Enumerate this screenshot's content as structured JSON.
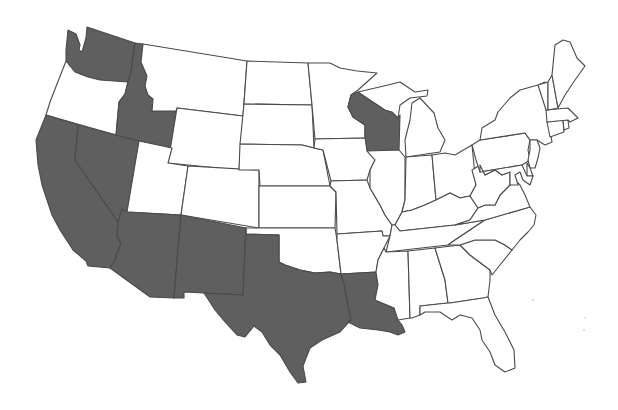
{
  "map": {
    "title": "",
    "region": "United States (contiguous)",
    "colors": {
      "highlighted": "#5f5f5f",
      "default": "#ffffff",
      "border": "#4a4a4a",
      "background": "#ffffff"
    },
    "highlighted_states": [
      "WA",
      "ID",
      "NV",
      "CA",
      "AZ",
      "NM",
      "TX",
      "LA",
      "WI"
    ],
    "states": [
      {
        "code": "WA",
        "name": "Washington",
        "highlighted": true
      },
      {
        "code": "OR",
        "name": "Oregon",
        "highlighted": false
      },
      {
        "code": "CA",
        "name": "California",
        "highlighted": true
      },
      {
        "code": "ID",
        "name": "Idaho",
        "highlighted": true
      },
      {
        "code": "NV",
        "name": "Nevada",
        "highlighted": true
      },
      {
        "code": "MT",
        "name": "Montana",
        "highlighted": false
      },
      {
        "code": "WY",
        "name": "Wyoming",
        "highlighted": false
      },
      {
        "code": "UT",
        "name": "Utah",
        "highlighted": false
      },
      {
        "code": "AZ",
        "name": "Arizona",
        "highlighted": true
      },
      {
        "code": "CO",
        "name": "Colorado",
        "highlighted": false
      },
      {
        "code": "NM",
        "name": "New Mexico",
        "highlighted": true
      },
      {
        "code": "ND",
        "name": "North Dakota",
        "highlighted": false
      },
      {
        "code": "SD",
        "name": "South Dakota",
        "highlighted": false
      },
      {
        "code": "NE",
        "name": "Nebraska",
        "highlighted": false
      },
      {
        "code": "KS",
        "name": "Kansas",
        "highlighted": false
      },
      {
        "code": "OK",
        "name": "Oklahoma",
        "highlighted": false
      },
      {
        "code": "TX",
        "name": "Texas",
        "highlighted": true
      },
      {
        "code": "MN",
        "name": "Minnesota",
        "highlighted": false
      },
      {
        "code": "IA",
        "name": "Iowa",
        "highlighted": false
      },
      {
        "code": "MO",
        "name": "Missouri",
        "highlighted": false
      },
      {
        "code": "AR",
        "name": "Arkansas",
        "highlighted": false
      },
      {
        "code": "LA",
        "name": "Louisiana",
        "highlighted": true
      },
      {
        "code": "WI",
        "name": "Wisconsin",
        "highlighted": true
      },
      {
        "code": "IL",
        "name": "Illinois",
        "highlighted": false
      },
      {
        "code": "MI",
        "name": "Michigan",
        "highlighted": false
      },
      {
        "code": "IN",
        "name": "Indiana",
        "highlighted": false
      },
      {
        "code": "OH",
        "name": "Ohio",
        "highlighted": false
      },
      {
        "code": "KY",
        "name": "Kentucky",
        "highlighted": false
      },
      {
        "code": "TN",
        "name": "Tennessee",
        "highlighted": false
      },
      {
        "code": "MS",
        "name": "Mississippi",
        "highlighted": false
      },
      {
        "code": "AL",
        "name": "Alabama",
        "highlighted": false
      },
      {
        "code": "GA",
        "name": "Georgia",
        "highlighted": false
      },
      {
        "code": "FL",
        "name": "Florida",
        "highlighted": false
      },
      {
        "code": "SC",
        "name": "South Carolina",
        "highlighted": false
      },
      {
        "code": "NC",
        "name": "North Carolina",
        "highlighted": false
      },
      {
        "code": "VA",
        "name": "Virginia",
        "highlighted": false
      },
      {
        "code": "WV",
        "name": "West Virginia",
        "highlighted": false
      },
      {
        "code": "PA",
        "name": "Pennsylvania",
        "highlighted": false
      },
      {
        "code": "NY",
        "name": "New York",
        "highlighted": false
      },
      {
        "code": "MD",
        "name": "Maryland",
        "highlighted": false
      },
      {
        "code": "DE",
        "name": "Delaware",
        "highlighted": false
      },
      {
        "code": "NJ",
        "name": "New Jersey",
        "highlighted": false
      },
      {
        "code": "CT",
        "name": "Connecticut",
        "highlighted": false
      },
      {
        "code": "RI",
        "name": "Rhode Island",
        "highlighted": false
      },
      {
        "code": "MA",
        "name": "Massachusetts",
        "highlighted": false
      },
      {
        "code": "VT",
        "name": "Vermont",
        "highlighted": false
      },
      {
        "code": "NH",
        "name": "New Hampshire",
        "highlighted": false
      },
      {
        "code": "ME",
        "name": "Maine",
        "highlighted": false
      }
    ]
  }
}
